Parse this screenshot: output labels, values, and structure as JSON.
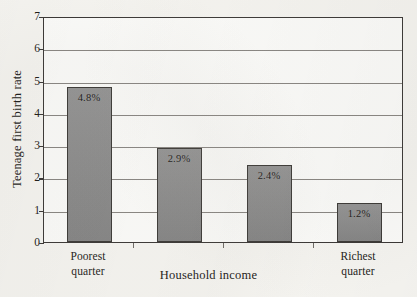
{
  "chart_data": {
    "type": "bar",
    "title": "",
    "xlabel": "Household income",
    "ylabel": "Teenage first birth rate",
    "categories": [
      "Poorest quarter",
      "",
      "",
      "Richest quarter"
    ],
    "category_lines": [
      [
        "Poorest",
        "quarter"
      ],
      [
        "",
        ""
      ],
      [
        "",
        ""
      ],
      [
        "Richest",
        "quarter"
      ]
    ],
    "values": [
      4.8,
      2.9,
      2.4,
      1.2
    ],
    "data_labels": [
      "4.8%",
      "2.9%",
      "2.4%",
      "1.2%"
    ],
    "ylim": [
      0,
      7
    ],
    "yticks": [
      0,
      1,
      2,
      3,
      4,
      5,
      6,
      7
    ],
    "ytick_labels": [
      "0",
      "1",
      "2",
      "3",
      "4",
      "5",
      "6",
      "7"
    ],
    "grid": true,
    "legend": "none",
    "bar_color": "#8c8c8c",
    "bar_edge_color": "#3b3936",
    "axis_color": "#3a3735",
    "grid_color": "#6f6b66",
    "plot_background": "#fdfdfb",
    "page_background": "#f7f6f2"
  }
}
